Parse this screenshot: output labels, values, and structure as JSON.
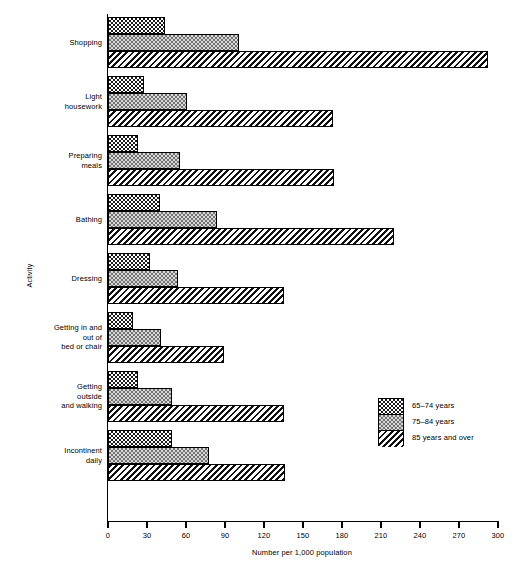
{
  "chart_data": {
    "type": "bar",
    "orientation": "horizontal",
    "title": "",
    "xlabel": "Number per 1,000 population",
    "ylabel": "Activity",
    "xlim": [
      0,
      300
    ],
    "xticks": [
      0,
      30,
      60,
      90,
      120,
      150,
      180,
      210,
      240,
      270,
      300
    ],
    "xtick_labels": [
      "0",
      "30",
      "60",
      "90",
      "120",
      "150",
      "180",
      "210",
      "240",
      "270",
      "300"
    ],
    "grid": false,
    "legend_position": "right-lower",
    "categories": [
      "Shopping",
      "Light housework",
      "Preparing meals",
      "Bathing",
      "Dressing",
      "Getting in and out of bed or chair",
      "Getting outside and walking",
      "Incontinent daily"
    ],
    "category_lines": [
      [
        "Shopping"
      ],
      [
        "Light",
        "housework"
      ],
      [
        "Preparing",
        "meals"
      ],
      [
        "Bathing"
      ],
      [
        "Dressing"
      ],
      [
        "Getting in and",
        "out of",
        "bed or chair"
      ],
      [
        "Getting",
        "outside",
        "and walking"
      ],
      [
        "Incontinent",
        "daily"
      ]
    ],
    "series": [
      {
        "name": "65–74 years",
        "pattern": "dense-dot",
        "values": [
          44,
          28,
          23,
          40,
          32,
          19,
          23,
          49
        ]
      },
      {
        "name": "75–84 years",
        "pattern": "stipple",
        "values": [
          101,
          61,
          55,
          84,
          54,
          41,
          49,
          78
        ]
      },
      {
        "name": "85 years and over",
        "pattern": "diagonal-hatch",
        "values": [
          292,
          173,
          174,
          220,
          135,
          89,
          135,
          136
        ]
      }
    ]
  },
  "legend": {
    "entries": [
      {
        "label": "65–74 years"
      },
      {
        "label": "75–84 years"
      },
      {
        "label": "85 years and over"
      }
    ]
  }
}
